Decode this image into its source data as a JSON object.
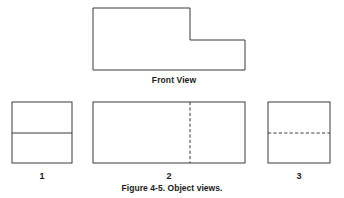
{
  "figure": {
    "caption": "Figure 4-5. Object views.",
    "background_color": "#ffffff",
    "line_color": "#3a3a3a",
    "text_color": "#1a1a1a",
    "width": 344,
    "height": 198
  },
  "front_view": {
    "label": "Front View",
    "label_x": 174,
    "label_y": 76,
    "shape_type": "L-shaped polygon with upper-right notch",
    "line_style": "solid",
    "points": [
      [
        93,
        8
      ],
      [
        190,
        8
      ],
      [
        190,
        40
      ],
      [
        245,
        40
      ],
      [
        245,
        70
      ],
      [
        93,
        70
      ]
    ]
  },
  "views": [
    {
      "number": "1",
      "label_x": 42,
      "label_y": 172,
      "rect": {
        "x": 12,
        "y": 102,
        "width": 60,
        "height": 61
      },
      "internal_lines": [
        {
          "orientation": "horizontal",
          "style": "solid",
          "x1": 12,
          "y1": 133,
          "x2": 72,
          "y2": 133
        }
      ]
    },
    {
      "number": "2",
      "label_x": 169,
      "label_y": 172,
      "rect": {
        "x": 93,
        "y": 102,
        "width": 152,
        "height": 61
      },
      "internal_lines": [
        {
          "orientation": "vertical",
          "style": "dashed",
          "x1": 190,
          "y1": 102,
          "x2": 190,
          "y2": 163
        }
      ]
    },
    {
      "number": "3",
      "label_x": 299,
      "label_y": 172,
      "rect": {
        "x": 268,
        "y": 102,
        "width": 62,
        "height": 61
      },
      "internal_lines": [
        {
          "orientation": "horizontal",
          "style": "dashed",
          "x1": 268,
          "y1": 133,
          "x2": 330,
          "y2": 133
        }
      ]
    }
  ],
  "caption_position": {
    "x": 172,
    "y": 184
  }
}
